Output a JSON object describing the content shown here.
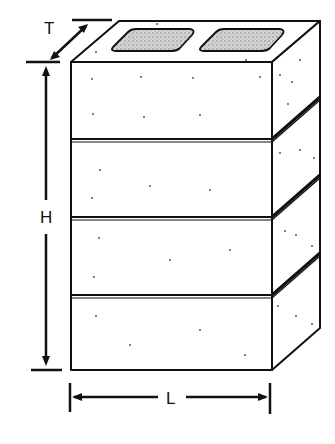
{
  "diagram": {
    "labels": {
      "thickness": "T",
      "height": "H",
      "length": "L"
    },
    "courses": 4,
    "cores": 2,
    "colors": {
      "line": "#111111",
      "background": "#ffffff",
      "core_fill": "#bdbdbd"
    }
  }
}
